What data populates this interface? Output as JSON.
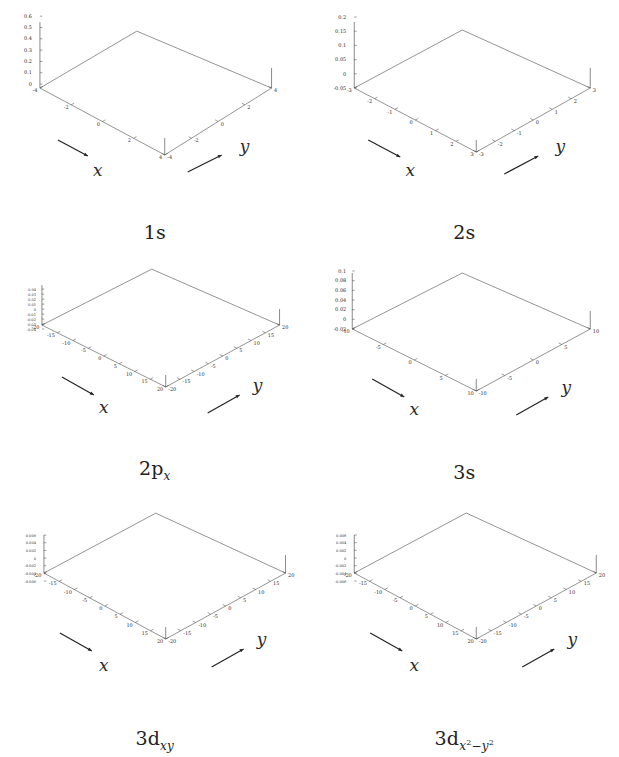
{
  "figure": {
    "background": "#ffffff",
    "mesh_color": "#555555",
    "axis_color": "#3a3a3a",
    "rows": 3,
    "columns": 2
  },
  "panels": [
    {
      "id": "1s",
      "caption_main": "1s",
      "caption_sub": "",
      "x_axis_label": "x",
      "y_axis_label": "y",
      "x_ticks": [
        "-4",
        "-2",
        "0",
        "2",
        "4"
      ],
      "y_ticks": [
        "-4",
        "-2",
        "0",
        "2",
        "4"
      ],
      "z_ticks": [
        "0.6",
        "0.5",
        "0.4",
        "0.3",
        "0.2",
        "0.1",
        "0"
      ],
      "x_range": [
        -5,
        5
      ],
      "y_range": [
        -5,
        5
      ],
      "z_range": [
        0,
        0.6
      ],
      "peak_value": 0.56,
      "baseline": 0.0,
      "nodes": 0,
      "description": "single sharp central cusp on a flat plane"
    },
    {
      "id": "2s",
      "caption_main": "2s",
      "caption_sub": "",
      "x_axis_label": "x",
      "y_axis_label": "y",
      "x_ticks": [
        "-3",
        "-2",
        "-1",
        "0",
        "1",
        "2",
        "3"
      ],
      "y_ticks": [
        "-3",
        "-2",
        "-1",
        "0",
        "1",
        "2",
        "3"
      ],
      "z_ticks": [
        "0.2",
        "0.15",
        "0.1",
        "0.05",
        "0",
        "-0.05"
      ],
      "x_range": [
        -3,
        3
      ],
      "y_range": [
        -3,
        3
      ],
      "z_range": [
        -0.05,
        0.2
      ],
      "peak_value": 0.2,
      "baseline": -0.02,
      "nodes": 1,
      "description": "broad cone with a single radial node ring"
    },
    {
      "id": "2px",
      "caption_main": "2p",
      "caption_sub": "x",
      "x_axis_label": "x",
      "y_axis_label": "y",
      "x_ticks": [
        "-20",
        "-15",
        "-10",
        "-5",
        "0",
        "5",
        "10",
        "15",
        "20"
      ],
      "y_ticks": [
        "-20",
        "-15",
        "-10",
        "-5",
        "0",
        "5",
        "10",
        "15",
        "20"
      ],
      "z_ticks": [
        "0.04",
        "0.03",
        "0.02",
        "0.01",
        "0",
        "-0.01",
        "-0.02",
        "-0.03",
        "-0.04"
      ],
      "x_range": [
        -20,
        20
      ],
      "y_range": [
        -20,
        20
      ],
      "z_range": [
        -0.04,
        0.04
      ],
      "peak_value": 0.04,
      "baseline": 0.0,
      "nodes": 1,
      "description": "antisymmetric lobe pair, one positive and one negative bump"
    },
    {
      "id": "3s",
      "caption_main": "3s",
      "caption_sub": "",
      "x_axis_label": "x",
      "y_axis_label": "y",
      "x_ticks": [
        "-10",
        "-5",
        "0",
        "5",
        "10"
      ],
      "y_ticks": [
        "-10",
        "-5",
        "0",
        "5",
        "10"
      ],
      "z_ticks": [
        "0.1",
        "0.08",
        "0.06",
        "0.04",
        "0.02",
        "0",
        "-0.02"
      ],
      "x_range": [
        -10,
        10
      ],
      "y_range": [
        -10,
        10
      ],
      "z_range": [
        -0.02,
        0.1
      ],
      "peak_value": 0.1,
      "baseline": 0.005,
      "nodes": 2,
      "description": "tall narrow spike with a surrounding negative trough ring"
    },
    {
      "id": "3dxy",
      "caption_main": "3d",
      "caption_sub": "xy",
      "x_axis_label": "x",
      "y_axis_label": "y",
      "x_ticks": [
        "-20",
        "-15",
        "-10",
        "-5",
        "0",
        "5",
        "10",
        "15",
        "20"
      ],
      "y_ticks": [
        "-20",
        "-15",
        "-10",
        "-5",
        "0",
        "5",
        "10",
        "15",
        "20"
      ],
      "z_ticks": [
        "0.006",
        "0.004",
        "0.002",
        "0",
        "-0.002",
        "-0.004",
        "-0.006"
      ],
      "x_range": [
        -20,
        20
      ],
      "y_range": [
        -20,
        20
      ],
      "z_range": [
        -0.006,
        0.006
      ],
      "peak_value": 0.006,
      "baseline": 0.0,
      "nodes": 2,
      "description": "four-lobed cloverleaf with alternating sign lobes"
    },
    {
      "id": "3dx2-y2",
      "caption_main": "3d",
      "caption_sub": "x2-y2",
      "caption_sub_parts": [
        "x",
        "2",
        "−",
        "y",
        "2"
      ],
      "x_axis_label": "x",
      "y_axis_label": "y",
      "x_ticks": [
        "-20",
        "-15",
        "-10",
        "-5",
        "0",
        "5",
        "10",
        "15",
        "20"
      ],
      "y_ticks": [
        "-20",
        "-15",
        "-10",
        "-5",
        "0",
        "5",
        "10",
        "15",
        "20"
      ],
      "z_ticks": [
        "0.006",
        "0.004",
        "0.002",
        "0",
        "-0.002",
        "-0.004",
        "-0.006"
      ],
      "x_range": [
        -20,
        20
      ],
      "y_range": [
        -20,
        20
      ],
      "z_range": [
        -0.006,
        0.006
      ],
      "peak_value": 0.006,
      "baseline": 0.0,
      "nodes": 2,
      "description": "four-lobed cloverleaf rotated 45 degrees relative to 3dxy"
    }
  ],
  "chart_data": {
    "type": "line",
    "xlabel": "x",
    "ylabel": "y",
    "zlabel": "ψ",
    "grid": false,
    "legend": "none",
    "projection": "3d-surface-mesh",
    "subplots": [
      {
        "name": "1s",
        "xlim": [
          -5,
          5
        ],
        "ylim": [
          -5,
          5
        ],
        "zlim": [
          0,
          0.6
        ],
        "xticks": [
          -4,
          -2,
          0,
          2,
          4
        ],
        "yticks": [
          -4,
          -2,
          0,
          2,
          4
        ],
        "zticks": [
          0,
          0.1,
          0.2,
          0.3,
          0.4,
          0.5,
          0.6
        ],
        "peak": 0.56,
        "radial_nodes": 0,
        "angular_nodes": 0
      },
      {
        "name": "2s",
        "xlim": [
          -3,
          3
        ],
        "ylim": [
          -3,
          3
        ],
        "zlim": [
          -0.05,
          0.2
        ],
        "xticks": [
          -3,
          -2,
          -1,
          0,
          1,
          2,
          3
        ],
        "yticks": [
          -3,
          -2,
          -1,
          0,
          1,
          2,
          3
        ],
        "zticks": [
          -0.05,
          0,
          0.05,
          0.1,
          0.15,
          0.2
        ],
        "peak": 0.2,
        "radial_nodes": 1,
        "angular_nodes": 0
      },
      {
        "name": "2p_x",
        "xlim": [
          -20,
          20
        ],
        "ylim": [
          -20,
          20
        ],
        "zlim": [
          -0.04,
          0.04
        ],
        "xticks": [
          -20,
          -15,
          -10,
          -5,
          0,
          5,
          10,
          15,
          20
        ],
        "yticks": [
          -20,
          -15,
          -10,
          -5,
          0,
          5,
          10,
          15,
          20
        ],
        "zticks": [
          -0.04,
          -0.03,
          -0.02,
          -0.01,
          0,
          0.01,
          0.02,
          0.03,
          0.04
        ],
        "peak": 0.04,
        "radial_nodes": 0,
        "angular_nodes": 1
      },
      {
        "name": "3s",
        "xlim": [
          -10,
          10
        ],
        "ylim": [
          -10,
          10
        ],
        "zlim": [
          -0.02,
          0.1
        ],
        "xticks": [
          -10,
          -5,
          0,
          5,
          10
        ],
        "yticks": [
          -10,
          -5,
          0,
          5,
          10
        ],
        "zticks": [
          -0.02,
          0,
          0.02,
          0.04,
          0.06,
          0.08,
          0.1
        ],
        "peak": 0.1,
        "radial_nodes": 2,
        "angular_nodes": 0
      },
      {
        "name": "3d_xy",
        "xlim": [
          -20,
          20
        ],
        "ylim": [
          -20,
          20
        ],
        "zlim": [
          -0.006,
          0.006
        ],
        "xticks": [
          -20,
          -15,
          -10,
          -5,
          0,
          5,
          10,
          15,
          20
        ],
        "yticks": [
          -20,
          -15,
          -10,
          -5,
          0,
          5,
          10,
          15,
          20
        ],
        "zticks": [
          -0.006,
          -0.004,
          -0.002,
          0,
          0.002,
          0.004,
          0.006
        ],
        "peak": 0.006,
        "radial_nodes": 0,
        "angular_nodes": 2
      },
      {
        "name": "3d_x2-y2",
        "xlim": [
          -20,
          20
        ],
        "ylim": [
          -20,
          20
        ],
        "zlim": [
          -0.006,
          0.006
        ],
        "xticks": [
          -20,
          -15,
          -10,
          -5,
          0,
          5,
          10,
          15,
          20
        ],
        "yticks": [
          -20,
          -15,
          -10,
          -5,
          0,
          5,
          10,
          15,
          20
        ],
        "zticks": [
          -0.006,
          -0.004,
          -0.002,
          0,
          0.002,
          0.004,
          0.006
        ],
        "peak": 0.006,
        "radial_nodes": 0,
        "angular_nodes": 2
      }
    ]
  }
}
